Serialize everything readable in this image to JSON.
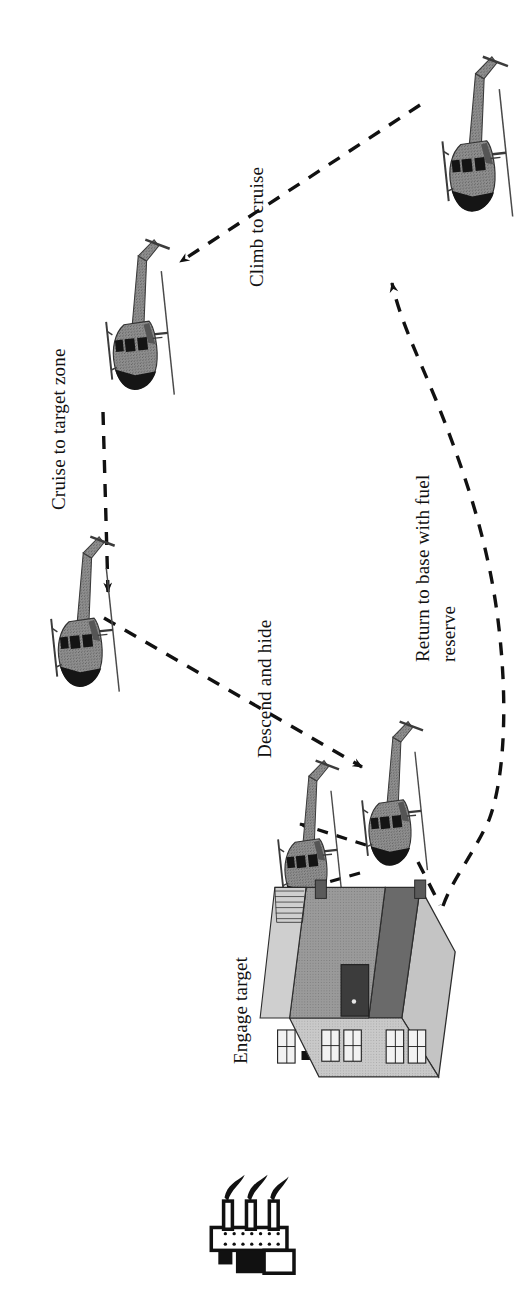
{
  "figure": {
    "kind": "mission-profile-diagram",
    "orientation_note": "page rotated 90 degrees counter-clockwise; labels read bottom-to-top",
    "background_color": "#ffffff",
    "ink_color": "#111111"
  },
  "labels": {
    "climb_to_cruise": "Climb to cruise",
    "cruise_to_target_zone": "Cruise to target zone",
    "descend_and_hide": "Descend and hide",
    "engage_target": "Engage target",
    "return_to_base_line1": "Return to base with fuel",
    "return_to_base_line2": "reserve"
  },
  "icons": {
    "helicopter": "helicopter-icon",
    "building": "building-icon",
    "rocket_launcher": "rocket-launcher-icon",
    "arrow": "arrow-icon",
    "weapon_fire": "weapon-fire-icon"
  },
  "elements": {
    "helicopters": [
      {
        "name": "helicopter-base-takeoff",
        "stage": "take-off / base",
        "x": 466,
        "y": 155,
        "angle": 84,
        "scale": 1.0
      },
      {
        "name": "helicopter-cruise",
        "stage": "cruise",
        "x": 129,
        "y": 335,
        "angle": 84,
        "scale": 0.97
      },
      {
        "name": "helicopter-approach",
        "stage": "approach target zone",
        "x": 74,
        "y": 632,
        "angle": 84,
        "scale": 0.97
      },
      {
        "name": "helicopter-hidden",
        "stage": "descend and hide",
        "x": 384,
        "y": 813,
        "angle": 84,
        "scale": 0.93
      },
      {
        "name": "helicopter-popup-firing",
        "stage": "engage target",
        "x": 300,
        "y": 850,
        "angle": 84,
        "scale": 0.93
      }
    ],
    "building": {
      "name": "building-icon",
      "x": 388,
      "y": 990,
      "label": "target building"
    },
    "rocket_launcher": {
      "name": "rocket-launcher-icon",
      "x": 333,
      "y": 1232,
      "label": "rocket launcher"
    },
    "paths": [
      {
        "name": "path-climb-to-cruise",
        "style": "dashed",
        "arrow": "end",
        "label_ref": "climb_to_cruise"
      },
      {
        "name": "path-cruise-to-target-zone",
        "style": "dashed",
        "arrow": "end",
        "label_ref": "cruise_to_target_zone"
      },
      {
        "name": "path-descend-and-hide",
        "style": "dashed",
        "arrow": "end",
        "label_ref": "descend_and_hide"
      },
      {
        "name": "path-popup",
        "style": "dashed",
        "arrow": "end",
        "label_ref": "engage_target"
      },
      {
        "name": "path-popdown",
        "style": "dashed",
        "arrow": "end",
        "label_ref": "engage_target"
      },
      {
        "name": "path-weapon-fire",
        "style": "thick-dashed",
        "arrow": "none",
        "label_ref": "engage_target"
      },
      {
        "name": "path-return-to-base",
        "style": "dashed",
        "arrow": "end",
        "label_ref": "return_to_base_line1"
      }
    ]
  }
}
